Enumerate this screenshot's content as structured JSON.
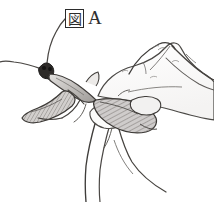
{
  "figure": {
    "label_mark": "図",
    "label_letter": "A",
    "label_full": "図 A",
    "caption": "図 A",
    "medium": "pen-and-ink line drawing, grayscale",
    "background_color": "#ffffff",
    "ink_color": "#3a3a3a",
    "dark_ink_color": "#1f1f1f",
    "shade_light": "#d8d6d4",
    "shade_mid": "#b3b0ad",
    "shade_dark": "#8d8a87",
    "parts": [
      {
        "name": "left-antenna",
        "label": "left antenna"
      },
      {
        "name": "right-antenna",
        "label": "right antenna"
      },
      {
        "name": "mantis-head",
        "label": "head"
      },
      {
        "name": "mantis-pronotum",
        "label": "pronotum"
      },
      {
        "name": "mantis-foreleg",
        "label": "raptorial foreleg"
      },
      {
        "name": "mantis-midleg",
        "label": "middle leg"
      },
      {
        "name": "mantis-wing",
        "label": "folded wing"
      },
      {
        "name": "mantis-abdomen",
        "label": "abdomen"
      },
      {
        "name": "hand-knuckle",
        "label": "knuckle"
      },
      {
        "name": "hand-thumb",
        "label": "thumb"
      },
      {
        "name": "hand-index-finger",
        "label": "index finger"
      },
      {
        "name": "hand-middle-finger",
        "label": "middle finger"
      },
      {
        "name": "hand-back",
        "label": "back of hand"
      }
    ]
  }
}
